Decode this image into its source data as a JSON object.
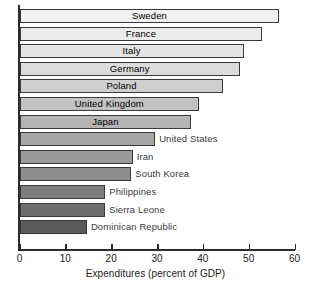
{
  "chart_data": {
    "type": "bar",
    "orientation": "horizontal",
    "title": "",
    "xlabel": "Expenditures (percent of GDP)",
    "ylabel": "",
    "xlim": [
      0,
      60
    ],
    "grid": false,
    "legend": null,
    "tick_labels": [
      "0",
      "10",
      "20",
      "30",
      "40",
      "50",
      "60"
    ],
    "tick_values": [
      0,
      10,
      20,
      30,
      40,
      50,
      60
    ],
    "categories": [
      "Sweden",
      "France",
      "Italy",
      "Germany",
      "Poland",
      "United Kingdom",
      "Japan",
      "United States",
      "Iran",
      "South Korea",
      "Philippines",
      "Sierra Leone",
      "Dominican Republic"
    ],
    "values": [
      56.7,
      53.0,
      48.9,
      48.1,
      44.5,
      39.2,
      37.5,
      29.6,
      24.7,
      24.4,
      18.7,
      18.7,
      14.7
    ],
    "bar_colors": [
      "#f2f2f2",
      "#ebebeb",
      "#e4e4e4",
      "#dcdcdc",
      "#cfcfcf",
      "#c2c2c2",
      "#b4b4b4",
      "#a6a6a6",
      "#9a9a9a",
      "#8d8d8d",
      "#7d7d7d",
      "#6e6e6e",
      "#5a5a5a"
    ],
    "label_placement": [
      "inside",
      "inside",
      "inside",
      "inside",
      "inside",
      "inside",
      "inside",
      "outside",
      "outside",
      "outside",
      "outside",
      "outside",
      "outside"
    ]
  },
  "axis": {
    "x_title": "Expenditures (percent of GDP)"
  },
  "colors": {
    "axis": "#2b2b2b",
    "bar_outline": "#3a3a3a",
    "background": "#ffffff",
    "label_inside": "#000000",
    "label_outside": "#3b3b3b"
  }
}
